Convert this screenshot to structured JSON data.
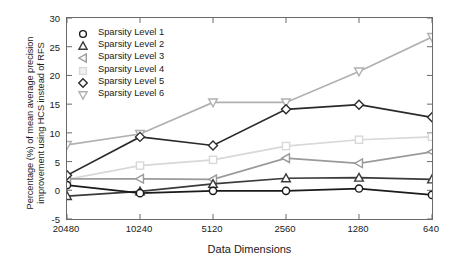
{
  "chart_data": {
    "type": "line",
    "title": "",
    "subtitle": "",
    "xlabel": "Data Dimensions",
    "ylabel": "Percentage (%) of mean average precision improvement using HCS instead of RFS",
    "ylabel_line1": "Percentage (%) of mean average precision",
    "ylabel_line2": "improvement using HCS instead of RFS",
    "categories": [
      "20480",
      "10240",
      "5120",
      "2560",
      "1280",
      "640"
    ],
    "x": [
      20480,
      10240,
      5120,
      2560,
      1280,
      640
    ],
    "xtick_labels": [
      "20480",
      "10240",
      "5120",
      "2560",
      "1280",
      "640"
    ],
    "ytick_labels": [
      "-5",
      "0",
      "5",
      "10",
      "15",
      "20",
      "25",
      "30"
    ],
    "yticks": [
      -5,
      0,
      5,
      10,
      15,
      20,
      25,
      30
    ],
    "ylim": [
      -5,
      30
    ],
    "grid": false,
    "legend_position": "upper-left",
    "series": [
      {
        "name": "Sparsity Level 1",
        "marker": "circle",
        "color": "#1a1a1a",
        "values": [
          0.9,
          -0.5,
          -0.1,
          -0.1,
          0.3,
          -0.8
        ]
      },
      {
        "name": "Sparsity Level 2",
        "marker": "triangle-up",
        "color": "#3a3a3a",
        "values": [
          -1.0,
          -0.2,
          1.1,
          2.1,
          2.2,
          1.9
        ]
      },
      {
        "name": "Sparsity Level 3",
        "marker": "triangle-left",
        "color": "#9a9a9a",
        "values": [
          2.0,
          2.0,
          1.9,
          5.6,
          4.7,
          6.7
        ]
      },
      {
        "name": "Sparsity Level 4",
        "marker": "square",
        "color": "#d8d8d8",
        "values": [
          1.9,
          4.3,
          5.3,
          7.7,
          8.8,
          9.3
        ]
      },
      {
        "name": "Sparsity Level 5",
        "marker": "diamond",
        "color": "#2a2a2a",
        "values": [
          2.6,
          9.3,
          7.8,
          14.1,
          14.9,
          12.7
        ]
      },
      {
        "name": "Sparsity Level 6",
        "marker": "triangle-down",
        "color": "#b0b0b0",
        "values": [
          7.9,
          9.8,
          15.3,
          15.3,
          20.7,
          26.7
        ]
      }
    ]
  }
}
